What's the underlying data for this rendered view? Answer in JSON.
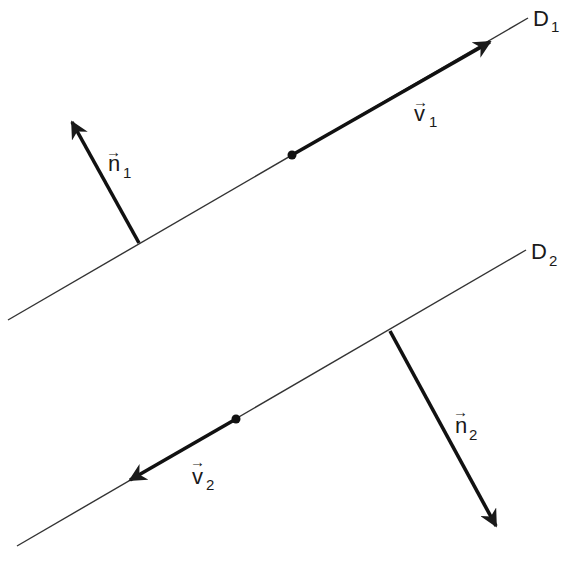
{
  "diagram": {
    "lines": [
      {
        "name": "D",
        "sub": "1"
      },
      {
        "name": "D",
        "sub": "2"
      }
    ],
    "vectors": {
      "n1": {
        "name": "n",
        "sub": "1",
        "arrow": "→"
      },
      "v1": {
        "name": "v",
        "sub": "1",
        "arrow": "→"
      },
      "n2": {
        "name": "n",
        "sub": "2",
        "arrow": "→"
      },
      "v2": {
        "name": "v",
        "sub": "2",
        "arrow": "→"
      }
    },
    "colors": {
      "stroke": "#1a1a1a",
      "background": "#ffffff"
    }
  }
}
